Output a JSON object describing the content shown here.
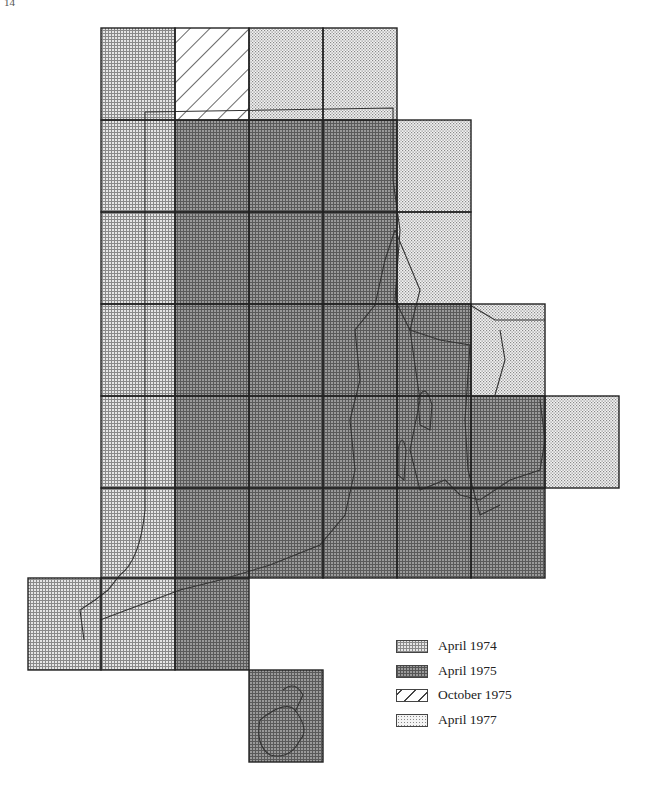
{
  "page": {
    "number": "14"
  },
  "figure": {
    "grid": {
      "col_x": [
        28,
        101,
        175,
        249,
        323,
        397,
        471,
        545,
        619
      ],
      "row_y": [
        28,
        120,
        212,
        304,
        396,
        488,
        578,
        670,
        762
      ]
    },
    "colors": {
      "April 1974": "#c8c8c8",
      "April 1975": "#8f8f8f",
      "October 1975": "#ffffff",
      "April 1977": "#e2e2e2"
    },
    "tiles": [
      {
        "c": 1,
        "r": 0,
        "cat": "April 1974"
      },
      {
        "c": 2,
        "r": 0,
        "cat": "October 1975"
      },
      {
        "c": 3,
        "r": 0,
        "cat": "April 1977"
      },
      {
        "c": 4,
        "r": 0,
        "cat": "April 1977"
      },
      {
        "c": 1,
        "r": 1,
        "cat": "April 1974"
      },
      {
        "c": 2,
        "r": 1,
        "cat": "April 1975"
      },
      {
        "c": 3,
        "r": 1,
        "cat": "April 1975"
      },
      {
        "c": 4,
        "r": 1,
        "cat": "April 1975"
      },
      {
        "c": 5,
        "r": 1,
        "cat": "April 1977"
      },
      {
        "c": 1,
        "r": 2,
        "cat": "April 1974"
      },
      {
        "c": 2,
        "r": 2,
        "cat": "April 1975"
      },
      {
        "c": 3,
        "r": 2,
        "cat": "April 1975"
      },
      {
        "c": 4,
        "r": 2,
        "cat": "April 1975"
      },
      {
        "c": 5,
        "r": 2,
        "cat": "April 1977"
      },
      {
        "c": 1,
        "r": 3,
        "cat": "April 1974"
      },
      {
        "c": 2,
        "r": 3,
        "cat": "April 1975"
      },
      {
        "c": 3,
        "r": 3,
        "cat": "April 1975"
      },
      {
        "c": 4,
        "r": 3,
        "cat": "April 1975"
      },
      {
        "c": 5,
        "r": 3,
        "cat": "April 1975"
      },
      {
        "c": 6,
        "r": 3,
        "cat": "April 1977"
      },
      {
        "c": 1,
        "r": 4,
        "cat": "April 1974"
      },
      {
        "c": 2,
        "r": 4,
        "cat": "April 1975"
      },
      {
        "c": 3,
        "r": 4,
        "cat": "April 1975"
      },
      {
        "c": 4,
        "r": 4,
        "cat": "April 1975"
      },
      {
        "c": 5,
        "r": 4,
        "cat": "April 1975"
      },
      {
        "c": 6,
        "r": 4,
        "cat": "April 1975"
      },
      {
        "c": 7,
        "r": 4,
        "cat": "April 1977"
      },
      {
        "c": 1,
        "r": 5,
        "cat": "April 1974"
      },
      {
        "c": 2,
        "r": 5,
        "cat": "April 1975"
      },
      {
        "c": 3,
        "r": 5,
        "cat": "April 1975"
      },
      {
        "c": 4,
        "r": 5,
        "cat": "April 1975"
      },
      {
        "c": 5,
        "r": 5,
        "cat": "April 1975"
      },
      {
        "c": 6,
        "r": 5,
        "cat": "April 1975"
      },
      {
        "c": 0,
        "r": 6,
        "cat": "April 1974"
      },
      {
        "c": 1,
        "r": 6,
        "cat": "April 1974"
      },
      {
        "c": 2,
        "r": 6,
        "cat": "April 1975"
      },
      {
        "c": 3,
        "r": 7,
        "cat": "April 1975"
      }
    ]
  },
  "legend": {
    "items": [
      {
        "label": "April 1974",
        "color": "#c8c8c8",
        "pattern": "fine-grid"
      },
      {
        "label": "April 1975",
        "color": "#8f8f8f",
        "pattern": "dense-grid"
      },
      {
        "label": "October 1975",
        "color": "#ffffff",
        "pattern": "diagonal-hatch"
      },
      {
        "label": "April 1977",
        "color": "#e2e2e2",
        "pattern": "dots"
      }
    ]
  }
}
